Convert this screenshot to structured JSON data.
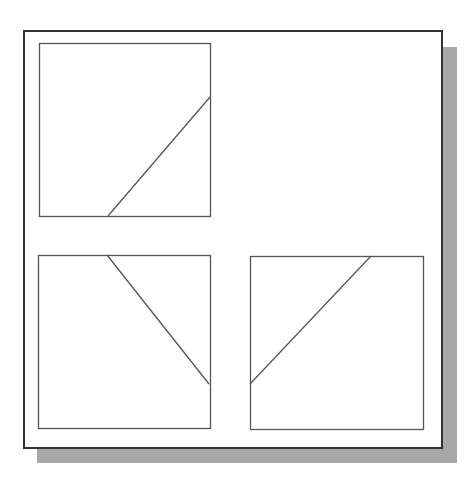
{
  "diagram": {
    "colors": {
      "frame": "#333333",
      "panel_border": "#555555",
      "line": "#555555",
      "shadow": "#a8a8a8",
      "background": "#ffffff"
    },
    "panels": [
      {
        "id": "top-left",
        "x": 39,
        "y": 43,
        "w": 171,
        "h": 173,
        "line": {
          "x1": 108,
          "y1": 216,
          "x2": 210,
          "y2": 97
        }
      },
      {
        "id": "bottom-left",
        "x": 38,
        "y": 255,
        "w": 172,
        "h": 173,
        "line": {
          "x1": 107,
          "y1": 255,
          "x2": 209,
          "y2": 384
        }
      },
      {
        "id": "bottom-right",
        "x": 250,
        "y": 256,
        "w": 173,
        "h": 173,
        "line": {
          "x1": 250,
          "y1": 384,
          "x2": 371,
          "y2": 256
        }
      }
    ]
  }
}
